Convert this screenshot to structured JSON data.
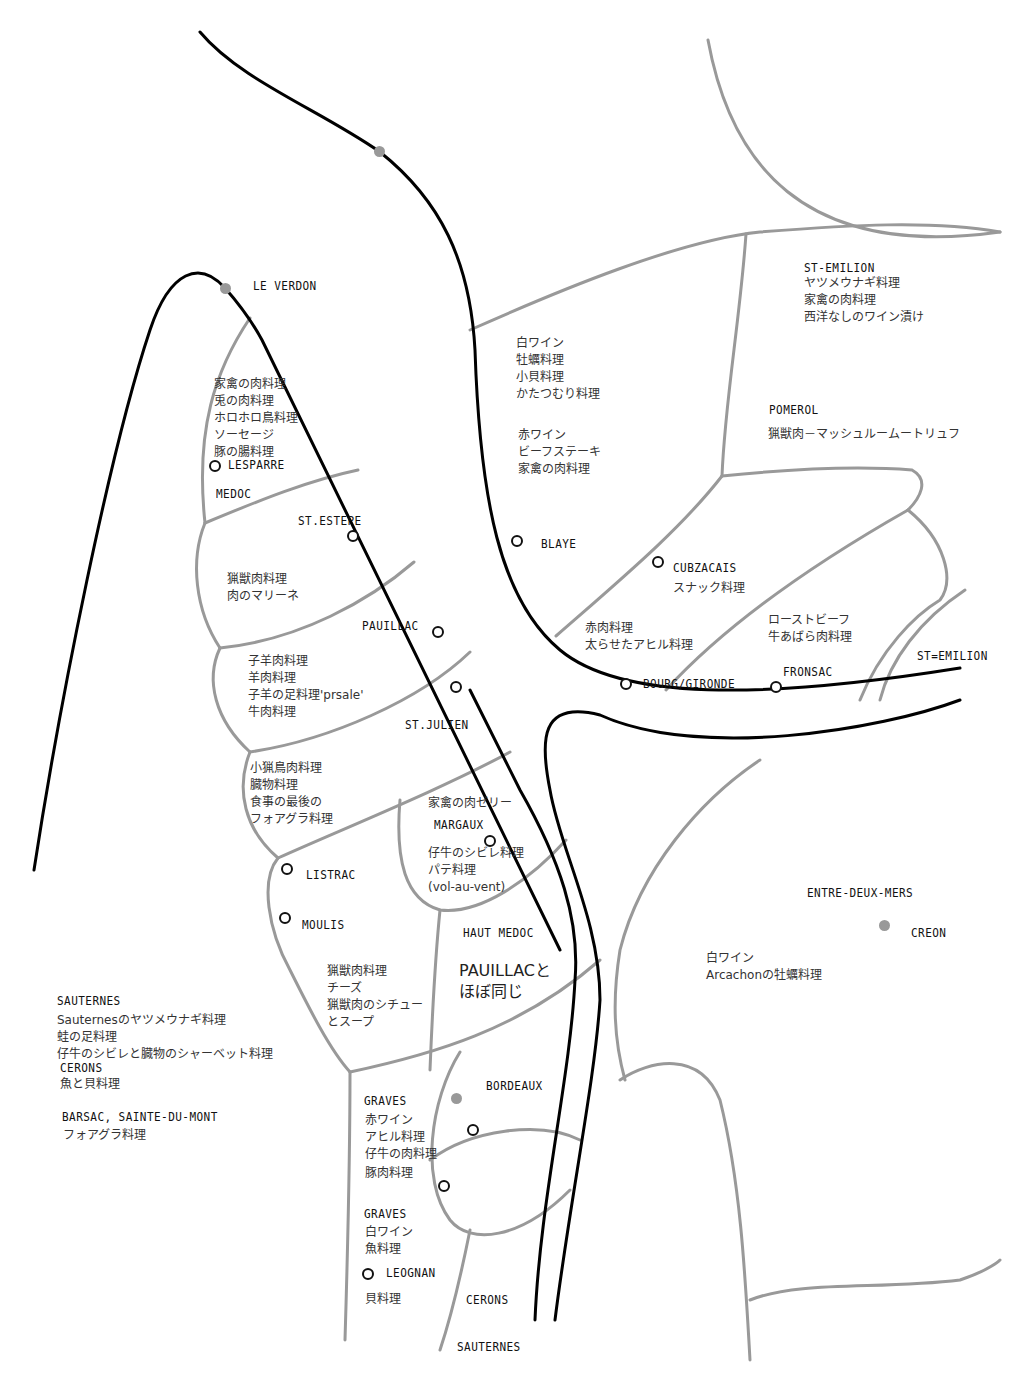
{
  "colors": {
    "river": "#000000",
    "border": "#999999",
    "city_dot": "#999999",
    "text": "#222222"
  },
  "places": {
    "le_verdon": "LE VERDON",
    "lesparre": "LESPARRE",
    "medoc": "MEDOC",
    "st_estephe": "ST.ESTEPE",
    "pauillac": "PAUILLAC",
    "st_julien": "ST.JULIEN",
    "margaux": "MARGAUX",
    "listrac": "LISTRAC",
    "moulis": "MOULIS",
    "haut_medoc": "HAUT MEDOC",
    "blaye": "BLAYE",
    "cubzacais": "CUBZACAIS",
    "bourg_gironde": "BOURG/GIRONDE",
    "fronsac": "FRONSAC",
    "st_emilion_top": "ST-EMILION",
    "st_emilion_right": "ST=EMILION",
    "pomerol": "POMEROL",
    "entre_deux_mers": "ENTRE-DEUX-MERS",
    "creon": "CREON",
    "bordeaux": "BORDEAUX",
    "graves_1": "GRAVES",
    "graves_2": "GRAVES",
    "leognan": "LEOGNAN",
    "cerons_bottom": "CERONS",
    "sauternes_bottom": "SAUTERNES",
    "sauternes_left": "SAUTERNES",
    "cerons_left": "CERONS",
    "barsac": "BARSAC, SAINTE-DU-MONT"
  },
  "foods": {
    "medoc_north": [
      "家禽の肉料理",
      "兎の肉料理",
      "ホロホロ鳥料理",
      "ソーセージ",
      "豚の腸料理"
    ],
    "st_estephe": [
      "猟獣肉料理",
      "肉のマリーネ"
    ],
    "pauillac": [
      "子羊肉料理",
      "羊肉料理",
      "子羊の足料理'prsale'",
      "牛肉料理"
    ],
    "st_julien": [
      "小猟鳥肉料理",
      "臓物料理",
      "食事の最後の",
      "フォアグラ料理"
    ],
    "margaux_top": [
      "家禽の肉ゼリー"
    ],
    "margaux": [
      "仔牛のシビレ料理",
      "パテ料理",
      "(vol-au-vent)"
    ],
    "listrac_moulis": [
      "猟獣肉料理",
      "チーズ",
      "猟獣肉のシチュー",
      "とスープ"
    ],
    "haut_medoc": [
      "PAUILLACと",
      "ほぼ同じ"
    ],
    "blaye_white": [
      "白ワイン",
      "牡蠣料理",
      "小貝料理",
      "かたつむり料理"
    ],
    "blaye_red": [
      "赤ワイン",
      "ビーフステーキ",
      "家禽の肉料理"
    ],
    "st_emilion": [
      "ヤツメウナギ料理",
      "家禽の肉料理",
      "西洋なしのワイン漬け"
    ],
    "pomerol": [
      "猟獣肉－マッシュルームートリュフ"
    ],
    "cubzacais": [
      "スナック料理"
    ],
    "bourg": [
      "赤肉料理",
      "太らせたアヒル料理"
    ],
    "fronsac": [
      "ローストビーフ",
      "牛あばら肉料理"
    ],
    "entre_deux_mers": [
      "白ワイン",
      "Arcachonの牡蠣料理"
    ],
    "sauternes": [
      "Sauternesのヤツメウナギ料理",
      "蛙の足料理",
      "仔牛のシビレと臓物のシャーベット料理"
    ],
    "cerons": [
      "魚と貝料理"
    ],
    "barsac": [
      "フォアグラ料理"
    ],
    "graves_red": [
      "赤ワイン",
      "アヒル料理",
      "仔牛の肉料理",
      "豚肉料理"
    ],
    "graves_white": [
      "白ワイン",
      "魚料理"
    ],
    "leognan": [
      "貝料理"
    ]
  }
}
